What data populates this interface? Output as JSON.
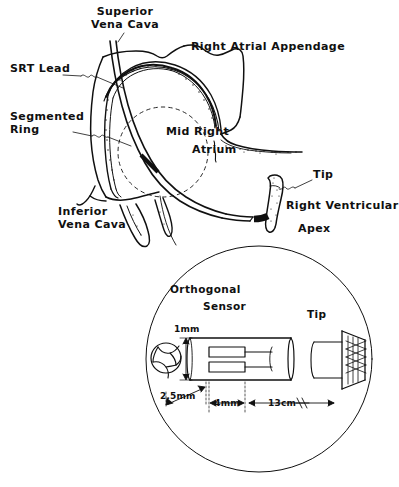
{
  "figure": {
    "background_color": "#ffffff",
    "ink_color": "#101010",
    "width": 399,
    "height": 487
  },
  "anatomy_labels": {
    "superior_vena_cava": "Superior\nVena Cava",
    "right_atrial_appendage": "Right Atrial Appendage",
    "srt_lead": "SRT Lead",
    "segmented_ring": "Segmented\nRing",
    "mid_right_atrium_line1": "Mid Right",
    "mid_right_atrium_line2": "Atrium",
    "inferior_vena_cava": "Inferior\nVena Cava",
    "tip": "Tip",
    "right_ventricular_line1": "Right Ventricular",
    "right_ventricular_line2": "Apex"
  },
  "detail_inset": {
    "orthogonal_sensor_line1": "Orthogonal",
    "orthogonal_sensor_line2": "Sensor",
    "tip": "Tip",
    "dimensions": {
      "diameter": "1mm",
      "sensor_offset": "2.5mm",
      "sensor_span": "4mm",
      "tip_distance": "13cm"
    }
  }
}
